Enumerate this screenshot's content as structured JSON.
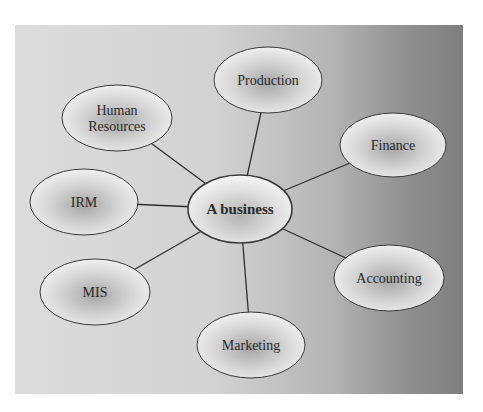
{
  "diagram": {
    "type": "hub-and-spoke",
    "panel": {
      "x": 15,
      "y": 25,
      "w": 448,
      "h": 369,
      "gradient": [
        "#dcdcdc",
        "#d4d4d4",
        "#b9b9b9",
        "#8c8c8c",
        "#7e7e7e"
      ]
    },
    "center": {
      "id": "business",
      "label": "A business",
      "cx": 240,
      "cy": 209,
      "rx": 52,
      "ry": 34,
      "bold": true
    },
    "nodes": [
      {
        "id": "production",
        "label": "Production",
        "lines": [
          "Production"
        ],
        "cx": 268,
        "cy": 80,
        "rx": 54,
        "ry": 33
      },
      {
        "id": "human-resources",
        "label": "Human Resources",
        "lines": [
          "Human",
          "Resources"
        ],
        "cx": 117,
        "cy": 118,
        "rx": 55,
        "ry": 33
      },
      {
        "id": "finance",
        "label": "Finance",
        "lines": [
          "Finance"
        ],
        "cx": 393,
        "cy": 145,
        "rx": 53,
        "ry": 32
      },
      {
        "id": "irm",
        "label": "IRM",
        "lines": [
          "IRM"
        ],
        "cx": 84,
        "cy": 202,
        "rx": 54,
        "ry": 33
      },
      {
        "id": "mis",
        "label": "MIS",
        "lines": [
          "MIS"
        ],
        "cx": 95,
        "cy": 292,
        "rx": 55,
        "ry": 33
      },
      {
        "id": "accounting",
        "label": "Accounting",
        "lines": [
          "Accounting"
        ],
        "cx": 389,
        "cy": 278,
        "rx": 55,
        "ry": 33
      },
      {
        "id": "marketing",
        "label": "Marketing",
        "lines": [
          "Marketing"
        ],
        "cx": 251,
        "cy": 345,
        "rx": 54,
        "ry": 33
      }
    ],
    "edges": [
      {
        "from": "business",
        "to": "production"
      },
      {
        "from": "business",
        "to": "human-resources"
      },
      {
        "from": "business",
        "to": "finance"
      },
      {
        "from": "business",
        "to": "irm"
      },
      {
        "from": "business",
        "to": "mis"
      },
      {
        "from": "business",
        "to": "accounting"
      },
      {
        "from": "business",
        "to": "marketing"
      }
    ],
    "colors": {
      "edge": "#2e2e2e",
      "stroke": "#3a3a3a",
      "node_light": "#f4f4f4",
      "node_dark": "#a9a9a9"
    }
  }
}
